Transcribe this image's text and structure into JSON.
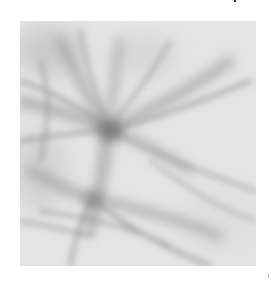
{
  "figure": {
    "kind": "grayscale micrograph",
    "colors": {
      "page_background": "#ffffff",
      "frame_background": "#e3e3e3",
      "fiber_dark": "#8a8a8a",
      "fiber_light": "#b5b5b5",
      "node_core": "#7a7a7a"
    }
  }
}
